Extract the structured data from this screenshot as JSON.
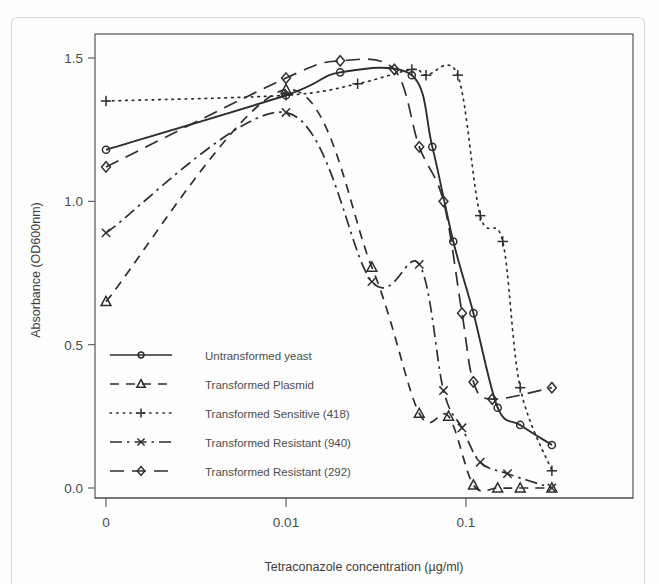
{
  "figure": {
    "background_color": "#fefefe",
    "ink_color": "#2e2e2e",
    "frame_color": "#555555"
  },
  "chart_data": {
    "type": "line",
    "title": "",
    "xlabel": "Tetraconazole concentration (µg/ml)",
    "ylabel": "Absorbance (OD600nm)",
    "x_scale": "log-like",
    "x_tick_labels": [
      "0",
      "0.01",
      "0.1"
    ],
    "x_tick_values": [
      0,
      0.01,
      0.1
    ],
    "y_tick_labels": [
      "0.0",
      "0.5",
      "1.0",
      "1.5"
    ],
    "y_tick_values": [
      0.0,
      0.5,
      1.0,
      1.5
    ],
    "ylim": [
      -0.08,
      1.62
    ],
    "grid": false,
    "legend_position": "lower-left-inside",
    "series": [
      {
        "name": "Untransformed yeast",
        "marker": "circle",
        "line_style": "solid",
        "x": [
          0,
          0.01,
          0.02,
          0.05,
          0.065,
          0.085,
          0.11,
          0.15,
          0.2,
          0.3
        ],
        "values": [
          1.18,
          1.37,
          1.45,
          1.44,
          1.19,
          0.86,
          0.61,
          0.28,
          0.22,
          0.15
        ]
      },
      {
        "name": "Transformed Plasmid",
        "marker": "triangle",
        "line_style": "dashed",
        "x": [
          0,
          0.01,
          0.03,
          0.055,
          0.08,
          0.11,
          0.15,
          0.2,
          0.3
        ],
        "values": [
          0.65,
          1.39,
          0.77,
          0.26,
          0.25,
          0.01,
          0.0,
          0.0,
          0.0
        ]
      },
      {
        "name": "Transformed Sensitive (418)",
        "marker": "plus",
        "line_style": "dotted",
        "x": [
          0,
          0.01,
          0.025,
          0.05,
          0.06,
          0.09,
          0.12,
          0.16,
          0.2,
          0.3
        ],
        "values": [
          1.35,
          1.37,
          1.41,
          1.46,
          1.44,
          1.44,
          0.95,
          0.86,
          0.35,
          0.06
        ]
      },
      {
        "name": "Transformed Resistant (940)",
        "marker": "cross",
        "line_style": "dashdot",
        "x": [
          0,
          0.01,
          0.03,
          0.055,
          0.075,
          0.095,
          0.12,
          0.17,
          0.3
        ],
        "values": [
          0.89,
          1.31,
          0.72,
          0.78,
          0.34,
          0.21,
          0.09,
          0.05,
          0.0
        ]
      },
      {
        "name": "Transformed Resistant (292)",
        "marker": "diamond",
        "line_style": "longdash",
        "x": [
          0,
          0.01,
          0.02,
          0.04,
          0.055,
          0.075,
          0.095,
          0.11,
          0.14,
          0.3
        ],
        "values": [
          1.12,
          1.43,
          1.49,
          1.46,
          1.19,
          1.0,
          0.61,
          0.37,
          0.31,
          0.35
        ]
      }
    ]
  },
  "legend": {
    "entries": [
      {
        "label": "Untransformed yeast",
        "marker": "circle",
        "line_style": "solid"
      },
      {
        "label": "Transformed Plasmid",
        "marker": "triangle",
        "line_style": "dashed"
      },
      {
        "label": "Transformed Sensitive (418)",
        "marker": "plus",
        "line_style": "dotted"
      },
      {
        "label": "Transformed Resistant (940)",
        "marker": "cross",
        "line_style": "dashdot"
      },
      {
        "label": "Transformed Resistant (292)",
        "marker": "diamond",
        "line_style": "longdash"
      }
    ]
  },
  "axes": {
    "x_title": "Tetraconazole concentration (µg/ml)",
    "y_title": "Absorbance (OD600nm)",
    "x_ticks": [
      "0",
      "0.01",
      "0.1"
    ],
    "y_ticks": [
      "1.5",
      "1.0",
      "0.5",
      "0.0"
    ]
  }
}
